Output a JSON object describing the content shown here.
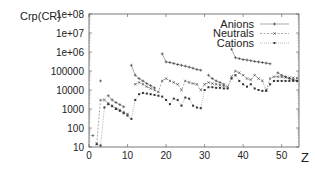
{
  "chart_data": {
    "type": "line",
    "title": "",
    "xlabel": "Z",
    "ylabel": "Crp(CR)",
    "yscale": "log",
    "xlim": [
      0,
      54.5
    ],
    "ylim": [
      10,
      100000000
    ],
    "x_ticks": [
      "0",
      "10",
      "20",
      "30",
      "40",
      "50"
    ],
    "y_ticks": [
      "10",
      "100",
      "1000",
      "10000",
      "100000",
      "1e+06",
      "1e+07",
      "1e+08"
    ],
    "legend_position": "upper right",
    "grid": false,
    "series": [
      {
        "name": "Anions",
        "style": "solid",
        "marker": "+",
        "points": [
          [
            1,
            40
          ],
          [
            3,
            30000
          ],
          [
            5,
            5000
          ],
          [
            6,
            3000
          ],
          [
            7,
            2200
          ],
          [
            8,
            1700
          ],
          [
            9,
            1300
          ],
          [
            11,
            200000
          ],
          [
            12,
            60000
          ],
          [
            13,
            40000
          ],
          [
            14,
            30000
          ],
          [
            15,
            22000
          ],
          [
            16,
            17000
          ],
          [
            17,
            13000
          ],
          [
            19,
            800000
          ],
          [
            20,
            300000
          ],
          [
            21,
            280000
          ],
          [
            22,
            250000
          ],
          [
            23,
            220000
          ],
          [
            24,
            200000
          ],
          [
            25,
            180000
          ],
          [
            26,
            160000
          ],
          [
            27,
            140000
          ],
          [
            28,
            120000
          ],
          [
            29,
            110000
          ],
          [
            31,
            60000
          ],
          [
            32,
            40000
          ],
          [
            33,
            30000
          ],
          [
            34,
            25000
          ],
          [
            35,
            20000
          ],
          [
            37,
            1400000
          ],
          [
            38,
            500000
          ],
          [
            39,
            450000
          ],
          [
            40,
            400000
          ],
          [
            41,
            380000
          ],
          [
            42,
            350000
          ],
          [
            43,
            320000
          ],
          [
            44,
            300000
          ],
          [
            45,
            280000
          ],
          [
            46,
            260000
          ],
          [
            47,
            240000
          ],
          [
            49,
            80000
          ],
          [
            50,
            60000
          ],
          [
            51,
            50000
          ],
          [
            52,
            40000
          ],
          [
            53,
            35000
          ],
          [
            54,
            30000
          ]
        ]
      },
      {
        "name": "Neutrals",
        "style": "dashed",
        "marker": "x",
        "points": [
          [
            2,
            15
          ],
          [
            3,
            3000
          ],
          [
            4,
            3000
          ],
          [
            5,
            2000
          ],
          [
            6,
            1500
          ],
          [
            7,
            1100
          ],
          [
            8,
            900
          ],
          [
            9,
            700
          ],
          [
            10,
            550
          ],
          [
            12,
            20000
          ],
          [
            13,
            25000
          ],
          [
            14,
            20000
          ],
          [
            15,
            15000
          ],
          [
            16,
            12000
          ],
          [
            17,
            10000
          ],
          [
            18,
            8000
          ],
          [
            19,
            30000
          ],
          [
            20,
            40000
          ],
          [
            21,
            30000
          ],
          [
            22,
            25000
          ],
          [
            23,
            20000
          ],
          [
            24,
            10000
          ],
          [
            25,
            30000
          ],
          [
            26,
            25000
          ],
          [
            27,
            22000
          ],
          [
            28,
            20000
          ],
          [
            29,
            10000
          ],
          [
            30,
            20000
          ],
          [
            31,
            25000
          ],
          [
            32,
            22000
          ],
          [
            33,
            20000
          ],
          [
            34,
            18000
          ],
          [
            35,
            16000
          ],
          [
            36,
            15000
          ],
          [
            37,
            50000
          ],
          [
            38,
            100000
          ],
          [
            39,
            80000
          ],
          [
            40,
            60000
          ],
          [
            41,
            40000
          ],
          [
            42,
            35000
          ],
          [
            43,
            60000
          ],
          [
            44,
            40000
          ],
          [
            45,
            30000
          ],
          [
            46,
            10000
          ],
          [
            47,
            40000
          ],
          [
            48,
            50000
          ],
          [
            49,
            50000
          ],
          [
            50,
            48000
          ],
          [
            51,
            46000
          ],
          [
            52,
            45000
          ],
          [
            53,
            44000
          ],
          [
            54,
            42000
          ]
        ]
      },
      {
        "name": "Cations",
        "style": "dotted",
        "marker": "*",
        "points": [
          [
            2,
            14
          ],
          [
            3,
            12
          ],
          [
            4,
            1200
          ],
          [
            5,
            1800
          ],
          [
            6,
            1400
          ],
          [
            7,
            1000
          ],
          [
            8,
            800
          ],
          [
            9,
            600
          ],
          [
            10,
            450
          ],
          [
            11,
            300
          ],
          [
            12,
            3000
          ],
          [
            13,
            6000
          ],
          [
            14,
            7000
          ],
          [
            15,
            6500
          ],
          [
            16,
            6000
          ],
          [
            17,
            5500
          ],
          [
            18,
            5000
          ],
          [
            19,
            4500
          ],
          [
            20,
            3000
          ],
          [
            21,
            1800
          ],
          [
            22,
            3500
          ],
          [
            23,
            3000
          ],
          [
            24,
            1500
          ],
          [
            25,
            4000
          ],
          [
            26,
            3500
          ],
          [
            27,
            1500
          ],
          [
            28,
            1200
          ],
          [
            29,
            1100
          ],
          [
            30,
            10000
          ],
          [
            31,
            14000
          ],
          [
            32,
            14000
          ],
          [
            33,
            13000
          ],
          [
            34,
            13000
          ],
          [
            35,
            12000
          ],
          [
            36,
            12000
          ],
          [
            37,
            40000
          ],
          [
            38,
            60000
          ],
          [
            39,
            30000
          ],
          [
            40,
            20000
          ],
          [
            41,
            15000
          ],
          [
            42,
            20000
          ],
          [
            43,
            12000
          ],
          [
            44,
            10000
          ],
          [
            45,
            9000
          ],
          [
            46,
            9000
          ],
          [
            47,
            20000
          ],
          [
            48,
            30000
          ],
          [
            49,
            30000
          ],
          [
            50,
            30000
          ],
          [
            51,
            30000
          ],
          [
            52,
            30000
          ],
          [
            53,
            30000
          ],
          [
            54,
            30000
          ]
        ]
      }
    ]
  },
  "axis": {
    "ylabel": "Crp(CR)",
    "xlabel": "Z"
  }
}
